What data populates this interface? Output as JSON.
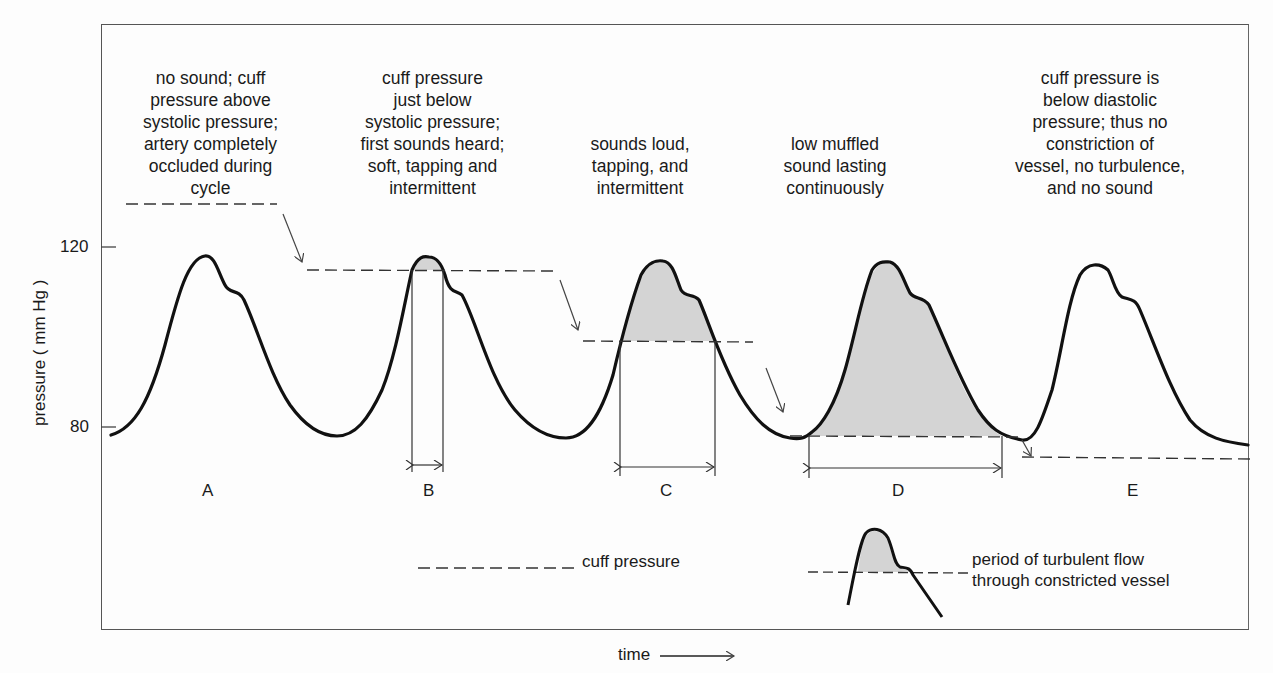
{
  "diagram": {
    "y_axis": {
      "label": "pressure ( mm Hg )",
      "ticks": [
        {
          "value": 120,
          "label": "120",
          "y": 247
        },
        {
          "value": 80,
          "label": "80",
          "y": 427
        }
      ]
    },
    "x_axis": {
      "label": "time"
    },
    "phases": [
      {
        "id": "A",
        "label": "A",
        "note": "no sound; cuff\npressure above\nsystolic pressure;\nartery completely\noccluded during\ncycle"
      },
      {
        "id": "B",
        "label": "B",
        "note": "cuff pressure\njust below\nsystolic pressure;\nfirst sounds heard;\nsoft, tapping and\nintermittent"
      },
      {
        "id": "C",
        "label": "C",
        "note": "sounds loud,\ntapping, and\nintermittent"
      },
      {
        "id": "D",
        "label": "D",
        "note": "low muffled\nsound lasting\ncontinuously"
      },
      {
        "id": "E",
        "label": "E",
        "note": "cuff pressure is\nbelow diastolic\npressure; thus no\nconstriction of\nvessel, no turbulence,\nand no sound"
      }
    ],
    "legend": {
      "cuff_pressure": "cuff pressure",
      "turbulent_flow": "period of turbulent flow\nthrough constricted vessel"
    },
    "colors": {
      "line": "#111111",
      "shade": "#d4d4d4",
      "dash": "#333333"
    }
  }
}
